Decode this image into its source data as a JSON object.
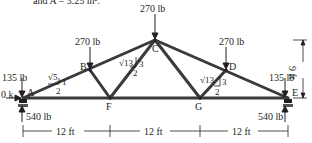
{
  "caption": "and A = 3.25 in².",
  "nodes": {
    "A": "A",
    "B": "B",
    "C": "C",
    "D": "D",
    "E": "E",
    "F": "F",
    "G": "G"
  },
  "loads": {
    "C": "270 lb",
    "B": "270 lb",
    "D": "270 lb",
    "A": "135 lb",
    "E": "135 lb",
    "A_horizontal": "0 k"
  },
  "reactions": {
    "A": "540 lb",
    "E": "540 lb"
  },
  "slopes": {
    "AB": {
      "hyp": "√5",
      "rise": "1",
      "run": "2"
    },
    "FC": {
      "hyp": "√13",
      "rise": "3",
      "run": "2"
    },
    "GD": {
      "hyp": "√13",
      "rise": "3",
      "run": "2"
    }
  },
  "dimensions": {
    "span1": "12 ft",
    "span2": "12 ft",
    "span3": "12 ft",
    "height": "9 ft"
  },
  "colors": {
    "member": "#3a3a3a",
    "text": "#231f20"
  }
}
